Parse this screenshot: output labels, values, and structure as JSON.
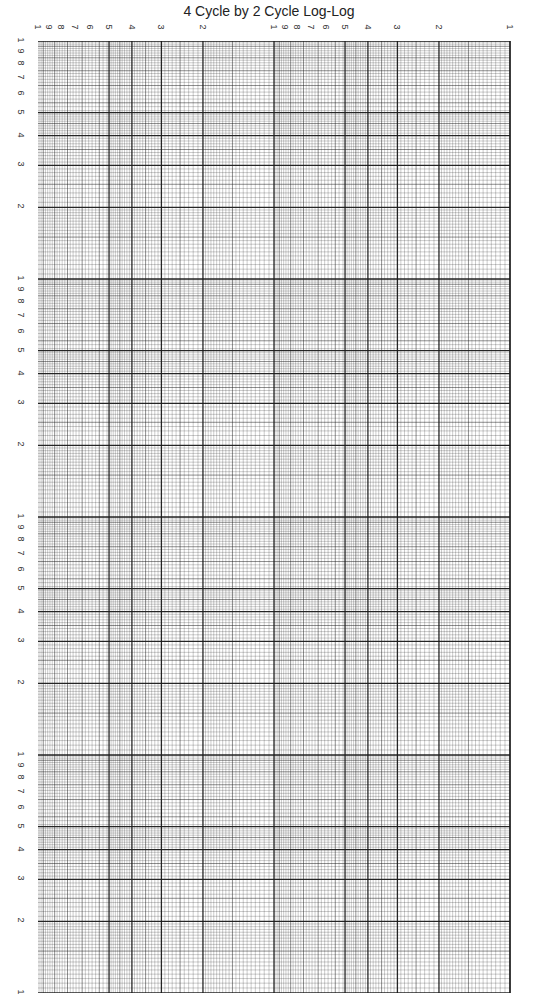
{
  "title": "4 Cycle by 2 Cycle Log-Log",
  "paper": {
    "x_cycles": 2,
    "y_cycles": 4,
    "x_direction": "decreasing left-to-right (1 at left of each cycle label row reading 1,9,8,7,6,5,4,3,2,1)",
    "line_color": "#1a1a1a"
  },
  "top_labels": [
    "1",
    "9",
    "8",
    "7",
    "6",
    "5",
    "4",
    "3",
    "2",
    "1",
    "9",
    "8",
    "7",
    "6",
    "5",
    "4",
    "3",
    "2",
    "1"
  ],
  "left_labels_per_cycle": [
    "1",
    "9",
    "8",
    "7",
    "6",
    "5",
    "4",
    "3",
    "2"
  ],
  "left_bottom_label": "1"
}
